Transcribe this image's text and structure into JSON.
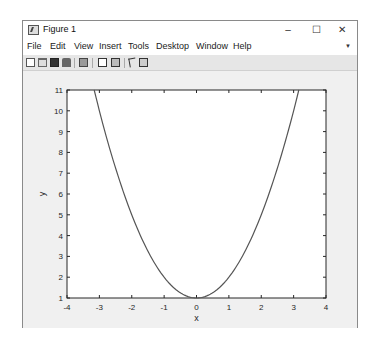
{
  "window": {
    "title": "Figure 1",
    "controls": {
      "minimize": "–",
      "maximize": "☐",
      "close": "✕"
    }
  },
  "menubar": {
    "items": [
      "File",
      "Edit",
      "View",
      "Insert",
      "Tools",
      "Desktop",
      "Window",
      "Help"
    ],
    "dock_arrow": "▼"
  },
  "toolbar": {
    "icons": [
      "new-figure-icon",
      "open-file-icon",
      "save-icon",
      "print-icon",
      "link-plot-icon",
      "insert-colorbar-icon",
      "insert-legend-icon",
      "edit-plot-icon",
      "plot-browser-icon"
    ]
  },
  "chart_data": {
    "type": "line",
    "title": "",
    "xlabel": "x",
    "ylabel": "y",
    "xlim": [
      -4,
      4
    ],
    "ylim": [
      1,
      11
    ],
    "xticks": [
      -4,
      -3,
      -2,
      -1,
      0,
      1,
      2,
      3,
      4
    ],
    "yticks": [
      1,
      2,
      3,
      4,
      5,
      6,
      7,
      8,
      9,
      10,
      11
    ],
    "grid": false,
    "legend": null,
    "series": [
      {
        "name": "y = x^2 + 1",
        "color": "#555555",
        "x": [
          -3.16,
          -3.0,
          -2.5,
          -2.0,
          -1.5,
          -1.0,
          -0.5,
          0.0,
          0.5,
          1.0,
          1.5,
          2.0,
          2.5,
          3.0,
          3.16
        ],
        "y": [
          11.0,
          10.0,
          7.25,
          5.0,
          3.25,
          2.0,
          1.25,
          1.0,
          1.25,
          2.0,
          3.25,
          5.0,
          7.25,
          10.0,
          11.0
        ]
      }
    ]
  }
}
